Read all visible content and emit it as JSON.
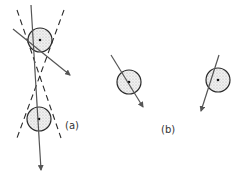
{
  "figure": {
    "labels": {
      "a": "(a)",
      "b": "(b)"
    },
    "colors": {
      "stroke": "#2a2a2a",
      "arrow": "#555555",
      "fill_dots": "#bdbdbd",
      "background": "#ffffff"
    },
    "panel_a": {
      "top_circle": {
        "cx": 40,
        "cy": 40,
        "r": 12
      },
      "bottom_circle": {
        "cx": 39,
        "cy": 119,
        "r": 12
      },
      "dashed_lines": [
        {
          "x1": 17,
          "y1": 10,
          "x2": 61,
          "y2": 138
        },
        {
          "x1": 64,
          "y1": 10,
          "x2": 17,
          "y2": 138
        }
      ],
      "vertical_arrow": {
        "x1": 31,
        "y1": 5,
        "x2": 41,
        "y2": 170
      },
      "diagonal_arrow": {
        "x1": 13,
        "y1": 29,
        "x2": 70,
        "y2": 75
      }
    },
    "panel_b": {
      "left_circle": {
        "cx": 129,
        "cy": 82,
        "r": 12
      },
      "left_arrow": {
        "x1": 111,
        "y1": 55,
        "x2": 143,
        "y2": 107
      },
      "right_circle": {
        "cx": 218,
        "cy": 80,
        "r": 12
      },
      "right_arrow": {
        "x1": 219,
        "y1": 55,
        "x2": 201,
        "y2": 111
      }
    }
  }
}
